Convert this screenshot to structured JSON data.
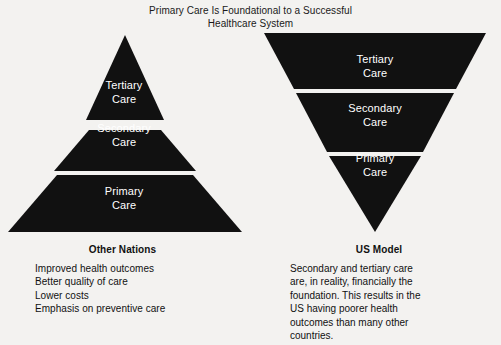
{
  "title": {
    "line1": "Primary Care Is Foundational to a Successful",
    "line2": "Healthcare System"
  },
  "colors": {
    "background": "#f3f2f0",
    "pyramid_fill": "#111111",
    "separator": "#ffffff",
    "text": "#111111",
    "tier_text": "#ffffff"
  },
  "diagram": {
    "left_pyramid": {
      "orientation": "upright",
      "tiers": [
        {
          "name": "tertiary",
          "label_line1": "Tertiary",
          "label_line2": "Care"
        },
        {
          "name": "secondary",
          "label_line1": "Secondary",
          "label_line2": "Care"
        },
        {
          "name": "primary",
          "label_line1": "Primary",
          "label_line2": "Care"
        }
      ]
    },
    "right_pyramid": {
      "orientation": "inverted",
      "tiers": [
        {
          "name": "tertiary",
          "label_line1": "Tertiary",
          "label_line2": "Care"
        },
        {
          "name": "secondary",
          "label_line1": "Secondary",
          "label_line2": "Care"
        },
        {
          "name": "primary",
          "label_line1": "Primary",
          "label_line2": "Care"
        }
      ]
    }
  },
  "captions": {
    "left": {
      "heading": "Other Nations",
      "lines": [
        "Improved health outcomes",
        "Better quality of care",
        "Lower costs",
        "Emphasis on preventive care"
      ]
    },
    "right": {
      "heading": "US Model",
      "lines": [
        "Secondary and tertiary care",
        "are, in reality, financially the",
        "foundation. This results in the",
        "US having poorer health",
        "outcomes than many other",
        "countries."
      ]
    }
  }
}
